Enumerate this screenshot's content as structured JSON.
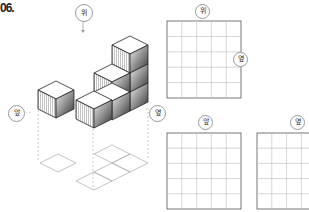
{
  "problem": {
    "number": "06."
  },
  "labels": {
    "top": "위",
    "front": "앞",
    "side": "옆"
  },
  "grids": [
    {
      "name": "top-view",
      "label": "위",
      "side_label": "옆",
      "rows": 5,
      "cols": 5
    },
    {
      "name": "front-view",
      "label": "앞",
      "rows": 5,
      "cols": 5
    },
    {
      "name": "side-view",
      "label": "옆",
      "rows": 5,
      "cols": 5
    }
  ],
  "colors": {
    "grid_line": "#b0b0b0",
    "border": "#555555",
    "dash": "#aaaaaa"
  }
}
